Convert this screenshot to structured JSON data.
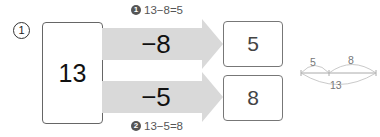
{
  "problem": {
    "number_label": "1",
    "whole": "13",
    "operations": [
      {
        "label": "−8",
        "equation_marker": "1",
        "equation": "13−8=5",
        "result": "5"
      },
      {
        "label": "−5",
        "equation_marker": "2",
        "equation": "13−5=8",
        "result": "8"
      }
    ],
    "number_bond": {
      "left_part": "5",
      "right_part": "8",
      "total": "13"
    }
  },
  "colors": {
    "arrow_fill": "#d9d9d9",
    "box_border": "#666666",
    "text": "#111111"
  }
}
